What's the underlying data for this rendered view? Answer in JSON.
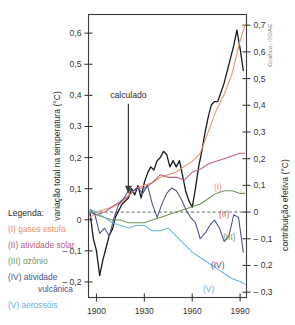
{
  "figure": {
    "top_partial_text": "",
    "credit": "Gráfico: ©DAE",
    "annotation": "calculado"
  },
  "legend": {
    "title": "Legenda:",
    "items": [
      {
        "label": "(I) gases estufa",
        "color": "#ef8f72"
      },
      {
        "label": "(II) atividade solar",
        "color": "#b8607a"
      },
      {
        "label": "(III) ozônio",
        "color": "#6f9455"
      },
      {
        "label": "(IV) atividade",
        "label2": "vulcânica",
        "color": "#4a4f85"
      },
      {
        "label": "(V) aerossóis",
        "color": "#6ab4d8"
      }
    ]
  },
  "curve_tags": [
    {
      "text": "(I)",
      "color": "#ef8f72"
    },
    {
      "text": "(II)",
      "color": "#b8607a"
    },
    {
      "text": "(III)",
      "color": "#6f9455"
    },
    {
      "text": "(IV)",
      "color": "#4a4f85"
    },
    {
      "text": "(V)",
      "color": "#6ab4d8"
    }
  ],
  "chart_data": {
    "type": "line",
    "title": "",
    "xlabel": "",
    "ylabel": "variação total na temperatura (°C)",
    "y2label": "contribuição efetiva (°C)",
    "xlim": [
      1895,
      1994
    ],
    "ylim": [
      -0.25,
      0.66
    ],
    "y2lim": [
      -0.32,
      0.74
    ],
    "grid": false,
    "legend_position": "left-outside",
    "xticks": [
      1900,
      1930,
      1960,
      1990
    ],
    "xtick_labels": [
      "1900",
      "1930",
      "1960",
      "1990"
    ],
    "yticks": [
      0.6,
      0.5,
      0.4,
      0.3,
      0.2,
      0.1,
      0,
      -0.1,
      -0.2
    ],
    "ytick_labels": [
      "0,6",
      "0,5",
      "0,4",
      "0,3",
      "0,2",
      "0,1",
      "0",
      "– 0,1",
      "– 0,2"
    ],
    "y2ticks": [
      0.7,
      0.6,
      0.5,
      0.4,
      0.3,
      0.2,
      0.1,
      0,
      -0.1,
      -0.2,
      -0.3
    ],
    "y2tick_labels": [
      "0,7",
      "0,6",
      "0,5",
      "0,4",
      "0,3",
      "0,2",
      "0,1",
      "0",
      "– 0,1",
      "– 0,2",
      "– 0,3"
    ],
    "annotations": [
      {
        "text": "calculado",
        "x": 1920,
        "y": 0.36,
        "arrow_to_y": 0.08
      }
    ],
    "series": [
      {
        "name": "variação total na temperatura (calculado)",
        "axis": "left",
        "color": "#1a1a1a",
        "x": [
          1896,
          1898,
          1900,
          1902,
          1904,
          1906,
          1908,
          1910,
          1912,
          1914,
          1916,
          1918,
          1920,
          1922,
          1924,
          1926,
          1928,
          1930,
          1932,
          1934,
          1936,
          1938,
          1940,
          1942,
          1944,
          1946,
          1948,
          1950,
          1952,
          1954,
          1956,
          1958,
          1960,
          1962,
          1964,
          1966,
          1968,
          1970,
          1972,
          1974,
          1976,
          1978,
          1980,
          1982,
          1984,
          1986,
          1988,
          1990,
          1992
        ],
        "values": [
          0.02,
          -0.06,
          -0.1,
          -0.18,
          -0.13,
          -0.09,
          -0.05,
          -0.03,
          0.01,
          0.03,
          0.05,
          0.06,
          0.07,
          0.1,
          0.08,
          0.11,
          0.07,
          0.12,
          0.15,
          0.17,
          0.16,
          0.19,
          0.2,
          0.22,
          0.21,
          0.17,
          0.19,
          0.17,
          0.19,
          0.14,
          0.09,
          0.06,
          0.04,
          0.1,
          0.17,
          0.22,
          0.28,
          0.33,
          0.37,
          0.38,
          0.38,
          0.41,
          0.44,
          0.48,
          0.52,
          0.56,
          0.61,
          0.55,
          0.48
        ]
      },
      {
        "name": "(I) gases estufa",
        "axis": "right",
        "color": "#ef8f72",
        "x": [
          1896,
          1900,
          1905,
          1910,
          1915,
          1920,
          1925,
          1930,
          1935,
          1940,
          1945,
          1950,
          1955,
          1960,
          1965,
          1970,
          1975,
          1980,
          1985,
          1990,
          1993
        ],
        "values": [
          -0.02,
          0.0,
          0.01,
          0.02,
          0.03,
          0.06,
          0.09,
          0.1,
          0.11,
          0.13,
          0.14,
          0.15,
          0.17,
          0.19,
          0.22,
          0.3,
          0.38,
          0.44,
          0.52,
          0.64,
          0.7
        ]
      },
      {
        "name": "(II) atividade solar",
        "axis": "right",
        "color": "#b8607a",
        "x": [
          1896,
          1900,
          1905,
          1910,
          1915,
          1920,
          1925,
          1930,
          1935,
          1940,
          1945,
          1950,
          1955,
          1960,
          1965,
          1970,
          1975,
          1980,
          1985,
          1990,
          1993
        ],
        "values": [
          0.0,
          -0.01,
          0.0,
          0.02,
          0.04,
          0.06,
          0.09,
          0.09,
          0.11,
          0.14,
          0.13,
          0.13,
          0.12,
          0.15,
          0.16,
          0.18,
          0.19,
          0.2,
          0.21,
          0.22,
          0.22
        ]
      },
      {
        "name": "(III) ozônio",
        "axis": "right",
        "color": "#6f9455",
        "x": [
          1896,
          1900,
          1905,
          1910,
          1915,
          1920,
          1925,
          1930,
          1935,
          1940,
          1945,
          1950,
          1955,
          1960,
          1965,
          1970,
          1975,
          1980,
          1985,
          1990,
          1993
        ],
        "values": [
          0.0,
          -0.01,
          -0.02,
          -0.03,
          -0.03,
          -0.04,
          -0.04,
          -0.04,
          -0.03,
          -0.02,
          -0.01,
          0.0,
          0.01,
          0.02,
          0.03,
          0.05,
          0.07,
          0.08,
          0.08,
          0.07,
          0.07
        ]
      },
      {
        "name": "(IV) atividade vulcânica",
        "axis": "right",
        "color": "#4a4f85",
        "x": [
          1896,
          1899,
          1902,
          1905,
          1908,
          1911,
          1914,
          1917,
          1920,
          1923,
          1926,
          1929,
          1932,
          1935,
          1938,
          1941,
          1944,
          1947,
          1950,
          1953,
          1956,
          1959,
          1962,
          1965,
          1968,
          1971,
          1974,
          1977,
          1980,
          1983,
          1986,
          1989,
          1992
        ],
        "values": [
          0.01,
          -0.01,
          -0.08,
          -0.06,
          -0.09,
          -0.02,
          0.03,
          0.05,
          0.08,
          0.08,
          0.09,
          0.07,
          0.1,
          0.03,
          -0.02,
          0.03,
          0.07,
          0.09,
          0.08,
          0.05,
          0.01,
          -0.02,
          -0.04,
          -0.1,
          -0.08,
          -0.05,
          -0.03,
          -0.06,
          -0.11,
          -0.09,
          -0.01,
          -0.02,
          -0.15
        ]
      },
      {
        "name": "(V) aerossóis",
        "axis": "right",
        "color": "#6ab4d8",
        "x": [
          1896,
          1900,
          1905,
          1910,
          1915,
          1920,
          1925,
          1930,
          1935,
          1940,
          1945,
          1950,
          1955,
          1960,
          1965,
          1970,
          1975,
          1980,
          1985,
          1990,
          1993
        ],
        "values": [
          0.01,
          0.0,
          -0.02,
          -0.04,
          -0.05,
          -0.06,
          -0.05,
          -0.05,
          -0.07,
          -0.07,
          -0.06,
          -0.09,
          -0.12,
          -0.15,
          -0.17,
          -0.19,
          -0.21,
          -0.23,
          -0.25,
          -0.26,
          -0.27
        ]
      }
    ]
  }
}
